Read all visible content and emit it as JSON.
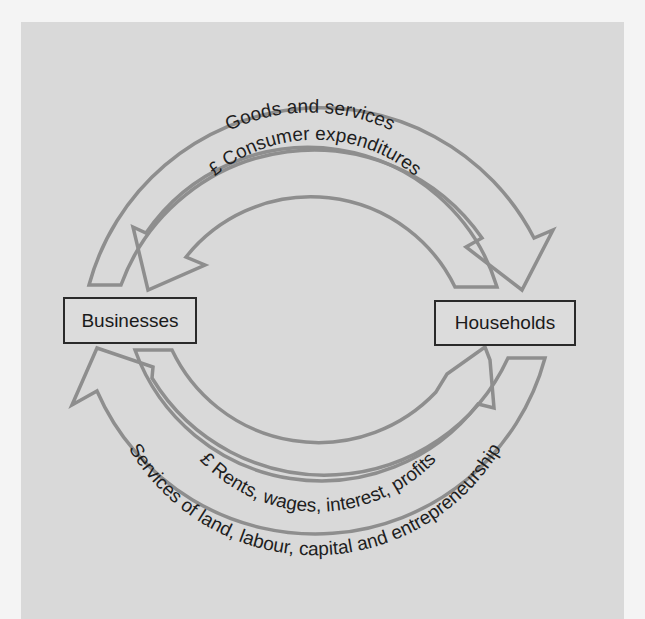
{
  "diagram": {
    "nodes": {
      "businesses": "Businesses",
      "households": "Households"
    },
    "flows": {
      "goods": {
        "label": "Goods and services",
        "from": "Businesses",
        "to": "Households"
      },
      "expenditure": {
        "label": "£ Consumer expenditures",
        "from": "Households",
        "to": "Businesses"
      },
      "factor_payments": {
        "label": "£ Rents, wages, interest, profits",
        "from": "Businesses",
        "to": "Households"
      },
      "factor_services": {
        "label": "Services of land, labour, capital and entrepreneurship",
        "from": "Households",
        "to": "Businesses"
      }
    },
    "colors": {
      "panel": "#d9d9d9",
      "arrow_stroke": "#8e8e8e",
      "box_border": "#2a2a2a",
      "text": "#1e1e1e"
    }
  }
}
